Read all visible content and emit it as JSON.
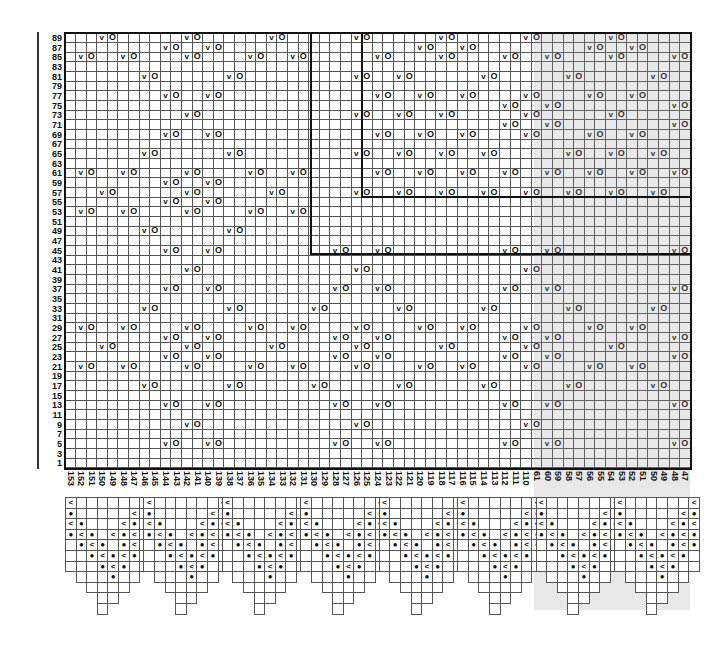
{
  "chart": {
    "title": "",
    "cols": 59,
    "col_width": 10.6,
    "row_height": 9.66,
    "row_labels": [
      89,
      87,
      85,
      83,
      81,
      79,
      77,
      75,
      73,
      71,
      69,
      67,
      65,
      63,
      61,
      59,
      57,
      55,
      53,
      51,
      49,
      47,
      45,
      43,
      41,
      39,
      37,
      35,
      33,
      31,
      29,
      27,
      25,
      23,
      21,
      19,
      17,
      15,
      13,
      11,
      9,
      7,
      5,
      3,
      1
    ],
    "col_labels": [
      "153",
      "152",
      "151",
      "150",
      "149",
      "148",
      "147",
      "146",
      "145",
      "144",
      "143",
      "142",
      "141",
      "140",
      "139",
      "138",
      "137",
      "136",
      "135",
      "134",
      "133",
      "132",
      "131",
      "130",
      "129",
      "128",
      "127",
      "126",
      "125",
      "124",
      "123",
      "122",
      "121",
      "120",
      "119",
      "118",
      "117",
      "116",
      "115",
      "114",
      "113",
      "112",
      "111",
      "110",
      "61",
      "60",
      "59",
      "58",
      "57",
      "56",
      "55",
      "54",
      "53",
      "52",
      "51",
      "50",
      "49",
      "48",
      "47"
    ],
    "symbols": {
      "v": "v",
      "o": "O",
      "dot": "●",
      "slip": "<"
    },
    "legend_note": "Each 'v' is followed by an 'O' in the next column",
    "rows_v": {
      "89": [
        3,
        11,
        19,
        27,
        35,
        43,
        51
      ],
      "87": [
        9,
        13,
        33,
        37,
        49,
        53
      ],
      "85": [
        1,
        5,
        11,
        17,
        21,
        29,
        35,
        41,
        45,
        51,
        57
      ],
      "83": [],
      "81": [
        7,
        15,
        27,
        31,
        39,
        47,
        55
      ],
      "79": [],
      "77": [
        9,
        13,
        29,
        33,
        37,
        43,
        49,
        53
      ],
      "75": [
        41,
        45,
        57
      ],
      "73": [
        11,
        27,
        31,
        35,
        43,
        51
      ],
      "71": [
        41,
        45,
        57
      ],
      "69": [
        9,
        13,
        29,
        33,
        37,
        43,
        49,
        53
      ],
      "67": [],
      "65": [
        7,
        15,
        27,
        31,
        35,
        39,
        47,
        51,
        55
      ],
      "63": [],
      "61": [
        1,
        5,
        11,
        17,
        21,
        29,
        33,
        37,
        41,
        45,
        49,
        53,
        57
      ],
      "59": [
        9,
        13
      ],
      "57": [
        3,
        11,
        19,
        27,
        31,
        35,
        39,
        43,
        47,
        51,
        55
      ],
      "55": [
        9,
        13
      ],
      "53": [
        1,
        5,
        11,
        17,
        21
      ],
      "51": [],
      "49": [
        7,
        15
      ],
      "47": [],
      "45": [
        9,
        13,
        25,
        29,
        41,
        45,
        57
      ],
      "43": [],
      "41": [
        11,
        27,
        43
      ],
      "39": [],
      "37": [
        9,
        13,
        25,
        29,
        41,
        45,
        57
      ],
      "35": [],
      "33": [
        7,
        15,
        23,
        31,
        39,
        47,
        55
      ],
      "31": [],
      "29": [
        1,
        5,
        11,
        17,
        21,
        27,
        33,
        37,
        43,
        49,
        53
      ],
      "27": [
        9,
        13,
        25,
        29,
        41,
        45,
        57
      ],
      "25": [
        3,
        11,
        19,
        27,
        35,
        43,
        51
      ],
      "23": [
        9,
        13,
        25,
        29,
        41,
        45,
        57
      ],
      "21": [
        1,
        5,
        11,
        17,
        21,
        27,
        33,
        37,
        43,
        49,
        53
      ],
      "19": [],
      "17": [
        7,
        15,
        23,
        31,
        39,
        47,
        55
      ],
      "15": [],
      "13": [
        9,
        13,
        25,
        29,
        41,
        45,
        57
      ],
      "11": [],
      "9": [
        11,
        27,
        43
      ],
      "7": [],
      "5": [
        9,
        13,
        25,
        29,
        41,
        45,
        57
      ],
      "3": [],
      "1": []
    },
    "thick_lines": [
      {
        "type": "v",
        "col": 23.2,
        "from_row_idx": 0,
        "to_row_idx": 22.9
      },
      {
        "type": "h",
        "row_idx": 22.9,
        "from_col": 23.2,
        "to_col": 59
      },
      {
        "type": "v",
        "col": 28,
        "from_row_idx": 0,
        "to_row_idx": 17
      },
      {
        "type": "h",
        "row_idx": 17,
        "from_col": 28,
        "to_col": 59
      }
    ],
    "shade": {
      "from_col": 44.2,
      "to_col": 59
    },
    "points": {
      "count": 8,
      "width": 8,
      "first_col": 0,
      "rows": [
        {
          "span": [
            0,
            7
          ],
          "marks": [
            [
              0,
              "slip"
            ],
            [
              7,
              "slip"
            ]
          ]
        },
        {
          "span": [
            0,
            7
          ],
          "marks": [
            [
              0,
              "dot"
            ],
            [
              6,
              "slip"
            ],
            [
              7,
              "dot"
            ]
          ]
        },
        {
          "span": [
            0,
            7
          ],
          "marks": [
            [
              0,
              "slip"
            ],
            [
              1,
              "dot"
            ],
            [
              5,
              "slip"
            ],
            [
              6,
              "dot"
            ],
            [
              7,
              "slip"
            ]
          ]
        },
        {
          "span": [
            0,
            7
          ],
          "marks": [
            [
              0,
              "dot"
            ],
            [
              1,
              "slip"
            ],
            [
              2,
              "dot"
            ],
            [
              4,
              "slip"
            ],
            [
              5,
              "dot"
            ],
            [
              6,
              "slip"
            ],
            [
              7,
              "dot"
            ]
          ]
        },
        {
          "span": [
            0,
            7
          ],
          "marks": [
            [
              1,
              "dot"
            ],
            [
              2,
              "slip"
            ],
            [
              3,
              "dot"
            ],
            [
              5,
              "dot"
            ],
            [
              6,
              "slip"
            ],
            [
              7,
              "dot"
            ]
          ]
        },
        {
          "span": [
            0,
            7
          ],
          "marks": [
            [
              2,
              "dot"
            ],
            [
              3,
              "slip"
            ],
            [
              4,
              "dot"
            ],
            [
              5,
              "slip"
            ],
            [
              6,
              "dot"
            ]
          ]
        },
        {
          "span": [
            0,
            7
          ],
          "marks": [
            [
              3,
              "dot"
            ],
            [
              4,
              "slip"
            ],
            [
              5,
              "dot"
            ]
          ]
        },
        {
          "span": [
            1,
            6
          ],
          "marks": [
            [
              4,
              "dot"
            ]
          ]
        },
        {
          "span": [
            2,
            5
          ],
          "marks": []
        },
        {
          "span": [
            3,
            4
          ],
          "marks": []
        },
        {
          "span": [
            3,
            3
          ],
          "marks": []
        }
      ]
    }
  }
}
